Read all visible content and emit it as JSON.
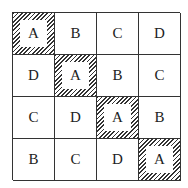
{
  "grid": {
    "rows": [
      [
        {
          "letter": "A",
          "highlighted": true
        },
        {
          "letter": "B",
          "highlighted": false
        },
        {
          "letter": "C",
          "highlighted": false
        },
        {
          "letter": "D",
          "highlighted": false
        }
      ],
      [
        {
          "letter": "D",
          "highlighted": false
        },
        {
          "letter": "A",
          "highlighted": true
        },
        {
          "letter": "B",
          "highlighted": false
        },
        {
          "letter": "C",
          "highlighted": false
        }
      ],
      [
        {
          "letter": "C",
          "highlighted": false
        },
        {
          "letter": "D",
          "highlighted": false
        },
        {
          "letter": "A",
          "highlighted": true
        },
        {
          "letter": "B",
          "highlighted": false
        }
      ],
      [
        {
          "letter": "B",
          "highlighted": false
        },
        {
          "letter": "C",
          "highlighted": false
        },
        {
          "letter": "D",
          "highlighted": false
        },
        {
          "letter": "A",
          "highlighted": true
        }
      ]
    ]
  }
}
